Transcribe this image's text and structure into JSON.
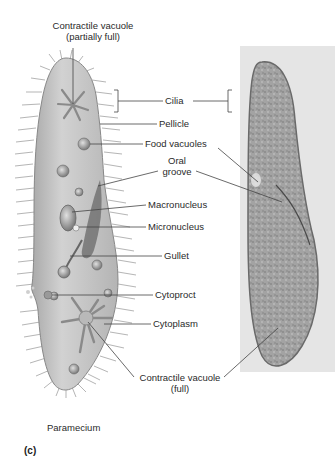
{
  "figure": {
    "panel_label": "(c)",
    "organism_caption": "Paramecium",
    "colors": {
      "body_fill": "#c9c9c9",
      "body_stroke": "#8a8a8a",
      "cilia": "#b0b0b0",
      "leader_line": "#444444",
      "micrograph_bg": "#d8d8d8",
      "micrograph_cell": "#9e9e9e"
    }
  },
  "labels": {
    "contractile_vacuole_partial_line1": "Contractile vacuole",
    "contractile_vacuole_partial_line2": "(partially full)",
    "cilia": "Cilia",
    "pellicle": "Pellicle",
    "food_vacuoles": "Food vacuoles",
    "oral_groove_line1": "Oral",
    "oral_groove_line2": "groove",
    "macronucleus": "Macronucleus",
    "micronucleus": "Micronucleus",
    "gullet": "Gullet",
    "cytoproct": "Cytoproct",
    "cytoplasm": "Cytoplasm",
    "contractile_vacuole_full_line1": "Contractile vacuole",
    "contractile_vacuole_full_line2": "(full)"
  }
}
